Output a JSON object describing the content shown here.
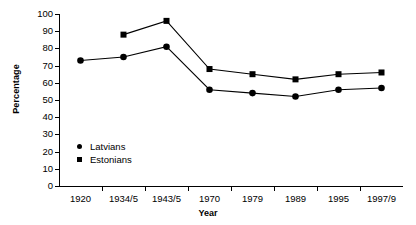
{
  "chart_data": {
    "type": "line",
    "title": "",
    "xlabel": "Year",
    "ylabel": "Percentage",
    "categories": [
      "1920",
      "1934/5",
      "1943/5",
      "1970",
      "1979",
      "1989",
      "1995",
      "1997/9"
    ],
    "ylim": [
      0,
      100
    ],
    "yticks": [
      0,
      10,
      20,
      30,
      40,
      50,
      60,
      70,
      80,
      90,
      100
    ],
    "grid": false,
    "legend_position": "inside-lower-left",
    "series": [
      {
        "name": "Latvians",
        "marker": "circle",
        "color": "#000000",
        "values": [
          73,
          75,
          81,
          56,
          54,
          52,
          56,
          57
        ]
      },
      {
        "name": "Estonians",
        "marker": "square",
        "color": "#000000",
        "values": [
          null,
          88,
          96,
          68,
          65,
          62,
          65,
          66
        ]
      }
    ]
  },
  "legend": {
    "items": [
      {
        "label": "Latvians",
        "marker": "circle"
      },
      {
        "label": "Estonians",
        "marker": "square"
      }
    ]
  }
}
